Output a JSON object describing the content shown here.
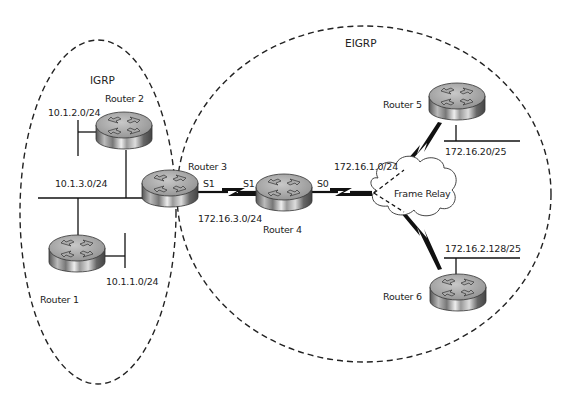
{
  "diagram": {
    "areas": [
      {
        "id": "igrp",
        "label": "IGRP"
      },
      {
        "id": "eigrp",
        "label": "EIGRP"
      }
    ],
    "routers": [
      {
        "id": "r1",
        "label": "Router 1"
      },
      {
        "id": "r2",
        "label": "Router 2"
      },
      {
        "id": "r3",
        "label": "Router 3"
      },
      {
        "id": "r4",
        "label": "Router 4"
      },
      {
        "id": "r5",
        "label": "Router 5"
      },
      {
        "id": "r6",
        "label": "Router 6"
      }
    ],
    "networks": {
      "n_10_1_2": "10.1.2.0/24",
      "n_10_1_3": "10.1.3.0/24",
      "n_10_1_1": "10.1.1.0/24",
      "n_172_16_3": "172.16.3.0/24",
      "n_172_16_1": "172.16.1.0/24",
      "n_172_16_20": "172.16.20/25",
      "n_172_16_2_128": "172.16.2.128/25"
    },
    "interfaces": {
      "r3_s1": "S1",
      "r4_s1": "S1",
      "r4_s0": "S0"
    },
    "cloud": {
      "label": "Frame Relay"
    }
  }
}
